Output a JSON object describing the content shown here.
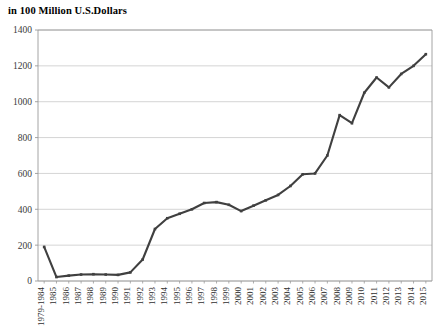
{
  "chart_title": "in 100 Million U.S.Dollars",
  "colors": {
    "line": "#404040",
    "gridline": "#c9c9c9",
    "axis": "#9a9a9a",
    "tick_text": "#333333",
    "background": "#ffffff"
  },
  "chart_data": {
    "type": "line",
    "title": "in 100 Million U.S.Dollars",
    "xlabel": "",
    "ylabel": "",
    "ylim": [
      0,
      1400
    ],
    "ytick_labels": [
      "0",
      "200",
      "400",
      "600",
      "800",
      "1000",
      "1200",
      "1400"
    ],
    "ytick_values": [
      0,
      200,
      400,
      600,
      800,
      1000,
      1200,
      1400
    ],
    "grid": "horizontal",
    "legend": "none",
    "markers": true,
    "categories": [
      "1979-1984",
      "1985",
      "1986",
      "1987",
      "1988",
      "1989",
      "1990",
      "1991",
      "1992",
      "1993",
      "1994",
      "1995",
      "1996",
      "1997",
      "1998",
      "1999",
      "2000",
      "2001",
      "2002",
      "2003",
      "2004",
      "2005",
      "2006",
      "2007",
      "2008",
      "2009",
      "2010",
      "2011",
      "2012",
      "2013",
      "2014",
      "2015"
    ],
    "values": [
      190,
      22,
      30,
      36,
      38,
      36,
      34,
      48,
      120,
      290,
      350,
      375,
      400,
      435,
      440,
      425,
      390,
      420,
      450,
      480,
      530,
      595,
      600,
      700,
      925,
      880,
      1050,
      1135,
      1080,
      1155,
      1200,
      1265
    ],
    "series": [
      {
        "name": "value",
        "values": [
          190,
          22,
          30,
          36,
          38,
          36,
          34,
          48,
          120,
          290,
          350,
          375,
          400,
          435,
          440,
          425,
          390,
          420,
          450,
          480,
          530,
          595,
          600,
          700,
          925,
          880,
          1050,
          1135,
          1080,
          1155,
          1200,
          1265
        ]
      }
    ]
  },
  "plot_geometry": {
    "left": 38,
    "right": 432,
    "top": 30,
    "bottom": 281
  }
}
